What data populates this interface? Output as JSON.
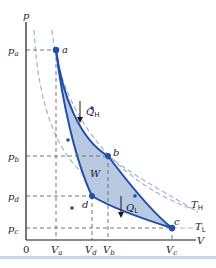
{
  "diagram": {
    "type": "Carnot cycle p-V diagram",
    "axes": {
      "y_label": "p",
      "x_label": "V",
      "origin_label": "0",
      "y_ticks": [
        {
          "base": "p",
          "sub": "a"
        },
        {
          "base": "p",
          "sub": "b"
        },
        {
          "base": "p",
          "sub": "d"
        },
        {
          "base": "p",
          "sub": "c"
        }
      ],
      "x_ticks": [
        {
          "base": "V",
          "sub": "a"
        },
        {
          "base": "V",
          "sub": "d"
        },
        {
          "base": "V",
          "sub": "b"
        },
        {
          "base": "V",
          "sub": "c"
        }
      ]
    },
    "points": [
      "a",
      "b",
      "c",
      "d"
    ],
    "labels": {
      "heat_in": {
        "base": "Q",
        "sub": "H"
      },
      "heat_out": {
        "base": "Q",
        "sub": "L"
      },
      "work": "W",
      "isotherm_high": {
        "base": "T",
        "sub": "H"
      },
      "isotherm_low": {
        "base": "T",
        "sub": "L"
      }
    },
    "colors": {
      "cycle_line": "#1f4fa8",
      "cycle_fill": "#b9c9e2",
      "isotherm_dashed": "#9fb3d4",
      "guide_dashed": "#666666",
      "axis": "#1a1a1a",
      "point": "#1f4fa8"
    }
  }
}
